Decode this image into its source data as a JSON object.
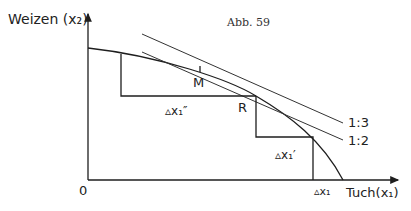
{
  "figure": {
    "caption": "Abb. 59",
    "y_axis_label": "Weizen (x₂)",
    "x_axis_label": "Tuch(x₁)",
    "origin_label": "0",
    "point_labels": {
      "M": "M",
      "R": "R"
    },
    "delta_labels": {
      "dx1_double_prime": "▵x₁″",
      "dx1_prime": "▵x₁′",
      "dx1": "▵x₁"
    },
    "tangent_labels": [
      "1:3",
      "1:2"
    ]
  }
}
